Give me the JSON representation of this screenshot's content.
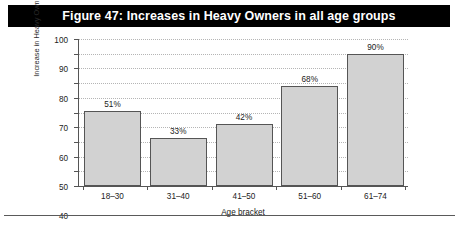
{
  "figure": {
    "title": "Figure 47: Increases in Heavy Owners in all age groups",
    "title_band_color": "#000000",
    "title_text_color": "#ffffff"
  },
  "chart_data": {
    "type": "bar",
    "title": "Figure 47: Increases in Heavy Owners in all age groups",
    "xlabel": "Age bracket",
    "ylabel_line1": "Increase in Heavy Owners",
    "ylabel_line2": "from 2000–2006",
    "categories": [
      "18–30",
      "31–40",
      "41–50",
      "51–60",
      "61–74"
    ],
    "values": [
      51,
      33,
      42,
      68,
      90
    ],
    "value_labels": [
      "51%",
      "33%",
      "42%",
      "68%",
      "90%"
    ],
    "ylim": [
      0,
      100
    ],
    "yticks": [
      0,
      10,
      20,
      30,
      40,
      50,
      60,
      70,
      80,
      90,
      100
    ],
    "ytick_labels": [
      "0",
      "10",
      "20",
      "30",
      "40",
      "50",
      "60",
      "70",
      "80",
      "90",
      "100"
    ],
    "grid": "horizontal-dotted",
    "legend": "none",
    "bar_fill": "#d2d2d2",
    "bar_border": "#555555"
  }
}
